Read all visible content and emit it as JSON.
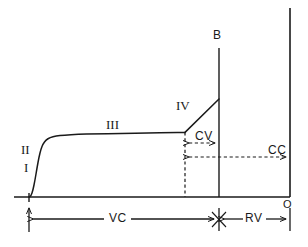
{
  "figure": {
    "background_color": "#ffffff",
    "line_color": "#1a1a1a"
  },
  "labels": {
    "phase1": "I",
    "phase2": "II",
    "phase3": "III",
    "phase4": "IV",
    "point_b": "B",
    "point_o": "O",
    "closing_volume": "CV",
    "closing_capacity": "CC",
    "vital_capacity": "VC",
    "residual_volume": "RV"
  },
  "chart_data": {
    "type": "line",
    "xlabel": "",
    "ylabel": "",
    "xlim": [
      0,
      308
    ],
    "ylim": [
      0,
      247
    ],
    "grid": false,
    "legend": null,
    "axes": {
      "baseline_y": 197,
      "baseline_x_start": 14,
      "baseline_x_end": 290,
      "right_axis_x": 290,
      "right_axis_y_top": 8,
      "right_axis_y_bottom": 197,
      "b_axis_x": 219,
      "b_axis_y_top": 48,
      "b_axis_y_bottom": 197
    },
    "curve": {
      "name": "expired nitrogen concentration",
      "points": [
        [
          29,
          197
        ],
        [
          31,
          196
        ],
        [
          33,
          190
        ],
        [
          35,
          180
        ],
        [
          37,
          168
        ],
        [
          39,
          157
        ],
        [
          41,
          149
        ],
        [
          43,
          144
        ],
        [
          46,
          140
        ],
        [
          50,
          137.5
        ],
        [
          56,
          136
        ],
        [
          64,
          135
        ],
        [
          78,
          134.3
        ],
        [
          95,
          133.9
        ],
        [
          120,
          133.4
        ],
        [
          150,
          132.9
        ],
        [
          170,
          132.6
        ],
        [
          185,
          132.4
        ]
      ]
    },
    "phase4_segment": {
      "name": "phase IV rise",
      "start": [
        185,
        132.4
      ],
      "end": [
        219,
        99
      ]
    },
    "dashed_vertical": {
      "x": 185,
      "y_top": 132.4,
      "y_bottom": 197
    },
    "cv_measure": {
      "label": "CV",
      "y": 143,
      "x_from": 185,
      "x_to": 219,
      "style": "dashed double-arrow"
    },
    "cc_measure": {
      "label": "CC",
      "y": 157,
      "x_from": 185,
      "x_to": 290,
      "style": "dashed double-arrow"
    },
    "vc_measure": {
      "label": "VC",
      "y": 219,
      "x_from": 29,
      "x_to": 219,
      "style": "solid double-arrow"
    },
    "rv_measure": {
      "label": "RV",
      "y": 219,
      "x_from": 219,
      "x_to": 290,
      "style": "solid double-arrow"
    },
    "annotations": [
      {
        "text": "I",
        "x": 27,
        "y": 168
      },
      {
        "text": "II",
        "x": 25,
        "y": 150
      },
      {
        "text": "III",
        "x": 110,
        "y": 125
      },
      {
        "text": "IV",
        "x": 178,
        "y": 106
      },
      {
        "text": "B",
        "x": 214,
        "y": 36
      },
      {
        "text": "O",
        "x": 284,
        "y": 207
      },
      {
        "text": "CV",
        "x": 197,
        "y": 137
      },
      {
        "text": "CC",
        "x": 270,
        "y": 152
      },
      {
        "text": "VC",
        "x": 117,
        "y": 219
      },
      {
        "text": "RV",
        "x": 249,
        "y": 219
      }
    ]
  }
}
